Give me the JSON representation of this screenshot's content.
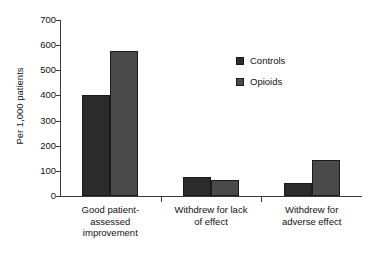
{
  "chart_data": {
    "type": "bar",
    "title": "",
    "xlabel": "",
    "ylabel": "Per 1,000 patients",
    "ylim": [
      0,
      700
    ],
    "yticks": [
      0,
      100,
      200,
      300,
      400,
      500,
      600,
      700
    ],
    "ytick_labels": [
      "0",
      "100",
      "200",
      "300",
      "400",
      "500",
      "600",
      "700"
    ],
    "grid": false,
    "legend_position": "upper-right-inside",
    "categories": [
      "Good patient-assessed improvement",
      "Withdrew for lack of effect",
      "Withdrew for adverse effect"
    ],
    "category_lines": [
      [
        "Good patient-",
        "assessed",
        "improvement"
      ],
      [
        "Withdrew for lack",
        "of effect"
      ],
      [
        "Withdrew for",
        "adverse effect"
      ]
    ],
    "series": [
      {
        "name": "Controls",
        "color": "#2b2b2b",
        "values": [
          400,
          75,
          52
        ]
      },
      {
        "name": "Opioids",
        "color": "#4a4a4a",
        "values": [
          578,
          62,
          143
        ]
      }
    ]
  },
  "legend": {
    "items": [
      {
        "label": "Controls",
        "swatch": "controls-swatch"
      },
      {
        "label": "Opioids",
        "swatch": "opioids-swatch"
      }
    ]
  }
}
